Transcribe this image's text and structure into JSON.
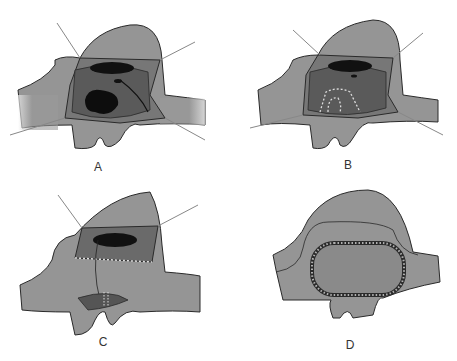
{
  "figure": {
    "panels": [
      {
        "id": "A",
        "label": "A",
        "description": "Defect exposed with retraction sutures; large dark opening in lower left of chamber"
      },
      {
        "id": "B",
        "label": "B",
        "description": "Defect edges being sutured with running dashed suture lines"
      },
      {
        "id": "C",
        "label": "C",
        "description": "Upper opening sutured; lower patch with suture closure"
      },
      {
        "id": "D",
        "label": "D",
        "description": "Final closure with continuous oval patch ring"
      }
    ],
    "colors": {
      "tissue": "#8c8c8c",
      "tissue_light": "#a8a8a8",
      "cavity": "#5a5a5a",
      "dark": "#111111",
      "outline": "#2a2a2a",
      "suture": "#d8d8d8"
    }
  }
}
